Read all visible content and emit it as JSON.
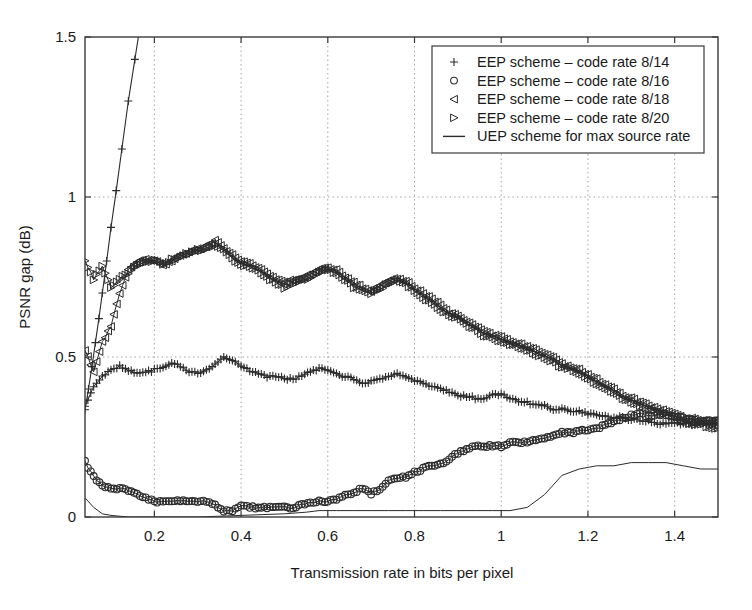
{
  "chart_data": {
    "type": "line",
    "title": "",
    "xlabel": "Transmission rate in bits per pixel",
    "ylabel": "PSNR gap (dB)",
    "xlim": [
      0.04,
      1.5
    ],
    "ylim": [
      0,
      1.5
    ],
    "xticks": [
      0.2,
      0.4,
      0.6,
      0.8,
      1,
      1.2,
      1.4
    ],
    "xtick_labels": [
      "0.2",
      "0.4",
      "0.6",
      "0.8",
      "1",
      "1.2",
      "1.4"
    ],
    "yticks": [
      0,
      0.5,
      1,
      1.5
    ],
    "ytick_labels": [
      "0",
      "0.5",
      "1",
      "1.5"
    ],
    "grid": "dotted-both-axes",
    "legend_position": "top-right",
    "line_color": "#2b2b2b",
    "grid_color": "#9a9a9a",
    "axis_color": "#3a3a3a",
    "series": [
      {
        "name": "EEP scheme – code rate 8/14",
        "marker": "plus",
        "x": [
          0.04,
          0.06,
          0.08,
          0.1,
          0.12,
          0.14,
          0.16,
          0.18,
          0.2,
          0.22,
          0.24,
          0.26,
          0.28,
          0.3,
          0.32,
          0.34,
          0.36,
          0.38,
          0.4,
          0.42,
          0.44,
          0.46,
          0.48,
          0.5,
          0.52,
          0.54,
          0.56,
          0.58,
          0.6,
          0.62,
          0.64,
          0.66,
          0.68,
          0.7,
          0.72,
          0.74,
          0.76,
          0.78,
          0.8,
          0.82,
          0.84,
          0.86,
          0.88,
          0.9,
          0.92,
          0.94,
          0.96,
          0.98,
          1.0,
          1.02,
          1.04,
          1.06,
          1.08,
          1.1,
          1.12,
          1.14,
          1.16,
          1.18,
          1.2,
          1.22,
          1.24,
          1.26,
          1.28,
          1.3,
          1.32,
          1.34,
          1.36,
          1.38,
          1.4,
          1.42,
          1.44,
          1.46,
          1.48,
          1.5
        ],
        "y": [
          0.35,
          0.4,
          0.44,
          0.46,
          0.47,
          0.46,
          0.45,
          0.45,
          0.46,
          0.47,
          0.48,
          0.47,
          0.46,
          0.45,
          0.46,
          0.48,
          0.5,
          0.49,
          0.47,
          0.46,
          0.45,
          0.44,
          0.44,
          0.43,
          0.43,
          0.44,
          0.45,
          0.46,
          0.46,
          0.45,
          0.44,
          0.43,
          0.42,
          0.42,
          0.43,
          0.44,
          0.45,
          0.44,
          0.43,
          0.42,
          0.41,
          0.4,
          0.39,
          0.38,
          0.38,
          0.37,
          0.37,
          0.38,
          0.38,
          0.37,
          0.36,
          0.36,
          0.35,
          0.35,
          0.34,
          0.34,
          0.33,
          0.33,
          0.32,
          0.32,
          0.31,
          0.31,
          0.31,
          0.3,
          0.3,
          0.3,
          0.29,
          0.29,
          0.29,
          0.29,
          0.29,
          0.29,
          0.29,
          0.29
        ],
        "note": "steep rising branch at left exits top of axes"
      },
      {
        "name": "EEP scheme – code rate 8/16",
        "marker": "circle",
        "x": [
          0.04,
          0.06,
          0.08,
          0.1,
          0.12,
          0.14,
          0.16,
          0.18,
          0.2,
          0.22,
          0.24,
          0.26,
          0.28,
          0.3,
          0.32,
          0.34,
          0.36,
          0.38,
          0.4,
          0.42,
          0.44,
          0.46,
          0.48,
          0.5,
          0.52,
          0.54,
          0.56,
          0.58,
          0.6,
          0.62,
          0.64,
          0.66,
          0.68,
          0.7,
          0.72,
          0.74,
          0.76,
          0.78,
          0.8,
          0.82,
          0.84,
          0.86,
          0.88,
          0.9,
          0.92,
          0.94,
          0.96,
          0.98,
          1.0,
          1.02,
          1.04,
          1.06,
          1.08,
          1.1,
          1.12,
          1.14,
          1.16,
          1.18,
          1.2,
          1.22,
          1.24,
          1.26,
          1.28,
          1.3,
          1.32,
          1.34,
          1.36,
          1.38,
          1.4,
          1.42,
          1.44,
          1.46,
          1.48,
          1.5
        ],
        "y": [
          0.17,
          0.13,
          0.1,
          0.09,
          0.09,
          0.08,
          0.07,
          0.06,
          0.05,
          0.05,
          0.05,
          0.05,
          0.05,
          0.05,
          0.05,
          0.04,
          0.02,
          0.02,
          0.03,
          0.03,
          0.03,
          0.03,
          0.03,
          0.03,
          0.03,
          0.04,
          0.04,
          0.05,
          0.05,
          0.06,
          0.07,
          0.08,
          0.09,
          0.07,
          0.09,
          0.11,
          0.12,
          0.13,
          0.14,
          0.15,
          0.16,
          0.17,
          0.18,
          0.2,
          0.21,
          0.22,
          0.22,
          0.22,
          0.22,
          0.23,
          0.23,
          0.24,
          0.24,
          0.25,
          0.25,
          0.26,
          0.26,
          0.27,
          0.27,
          0.28,
          0.29,
          0.3,
          0.31,
          0.32,
          0.32,
          0.32,
          0.32,
          0.32,
          0.31,
          0.31,
          0.3,
          0.3,
          0.3,
          0.3
        ]
      },
      {
        "name": "EEP scheme – code rate 8/18",
        "marker": "triangle-left",
        "x": [
          0.04,
          0.06,
          0.08,
          0.1,
          0.12,
          0.14,
          0.16,
          0.18,
          0.2,
          0.22,
          0.24,
          0.26,
          0.28,
          0.3,
          0.32,
          0.34,
          0.36,
          0.38,
          0.4,
          0.42,
          0.44,
          0.46,
          0.48,
          0.5,
          0.52,
          0.54,
          0.56,
          0.58,
          0.6,
          0.62,
          0.64,
          0.66,
          0.68,
          0.7,
          0.72,
          0.74,
          0.76,
          0.78,
          0.8,
          0.82,
          0.84,
          0.86,
          0.88,
          0.9,
          0.92,
          0.94,
          0.96,
          0.98,
          1.0,
          1.02,
          1.04,
          1.06,
          1.08,
          1.1,
          1.12,
          1.14,
          1.16,
          1.18,
          1.2,
          1.22,
          1.24,
          1.26,
          1.28,
          1.3,
          1.32,
          1.34,
          1.36,
          1.38,
          1.4,
          1.42,
          1.44,
          1.46,
          1.48,
          1.5
        ],
        "y": [
          0.52,
          0.46,
          0.55,
          0.6,
          0.7,
          0.78,
          0.8,
          0.81,
          0.8,
          0.79,
          0.8,
          0.82,
          0.83,
          0.84,
          0.85,
          0.86,
          0.84,
          0.82,
          0.8,
          0.79,
          0.78,
          0.76,
          0.74,
          0.73,
          0.74,
          0.75,
          0.76,
          0.77,
          0.78,
          0.77,
          0.75,
          0.73,
          0.72,
          0.71,
          0.72,
          0.74,
          0.75,
          0.74,
          0.72,
          0.7,
          0.68,
          0.66,
          0.64,
          0.63,
          0.61,
          0.6,
          0.58,
          0.57,
          0.56,
          0.55,
          0.54,
          0.53,
          0.52,
          0.51,
          0.5,
          0.48,
          0.47,
          0.46,
          0.44,
          0.43,
          0.41,
          0.4,
          0.38,
          0.37,
          0.36,
          0.35,
          0.34,
          0.33,
          0.32,
          0.31,
          0.31,
          0.3,
          0.3,
          0.3
        ]
      },
      {
        "name": "EEP scheme – code rate 8/20",
        "marker": "triangle-right",
        "x": [
          0.04,
          0.06,
          0.08,
          0.1,
          0.12,
          0.14,
          0.16,
          0.18,
          0.2,
          0.22,
          0.24,
          0.26,
          0.28,
          0.3,
          0.32,
          0.34,
          0.36,
          0.38,
          0.4,
          0.42,
          0.44,
          0.46,
          0.48,
          0.5,
          0.52,
          0.54,
          0.56,
          0.58,
          0.6,
          0.62,
          0.64,
          0.66,
          0.68,
          0.7,
          0.72,
          0.74,
          0.76,
          0.78,
          0.8,
          0.82,
          0.84,
          0.86,
          0.88,
          0.9,
          0.92,
          0.94,
          0.96,
          0.98,
          1.0,
          1.02,
          1.04,
          1.06,
          1.08,
          1.1,
          1.12,
          1.14,
          1.16,
          1.18,
          1.2,
          1.22,
          1.24,
          1.26,
          1.28,
          1.3,
          1.32,
          1.34,
          1.36,
          1.38,
          1.4,
          1.42,
          1.44,
          1.46,
          1.48,
          1.5
        ],
        "y": [
          0.8,
          0.74,
          0.78,
          0.72,
          0.74,
          0.76,
          0.79,
          0.8,
          0.8,
          0.79,
          0.8,
          0.81,
          0.82,
          0.83,
          0.84,
          0.85,
          0.83,
          0.81,
          0.79,
          0.78,
          0.77,
          0.75,
          0.73,
          0.72,
          0.73,
          0.74,
          0.75,
          0.76,
          0.77,
          0.76,
          0.74,
          0.72,
          0.71,
          0.7,
          0.71,
          0.73,
          0.74,
          0.73,
          0.71,
          0.69,
          0.67,
          0.65,
          0.63,
          0.62,
          0.6,
          0.59,
          0.57,
          0.56,
          0.55,
          0.54,
          0.53,
          0.52,
          0.51,
          0.5,
          0.49,
          0.47,
          0.46,
          0.45,
          0.43,
          0.42,
          0.4,
          0.39,
          0.37,
          0.36,
          0.35,
          0.34,
          0.33,
          0.32,
          0.31,
          0.3,
          0.29,
          0.29,
          0.28,
          0.28
        ]
      },
      {
        "name": "UEP scheme for max source rate",
        "marker": "none",
        "x": [
          0.04,
          0.06,
          0.08,
          0.1,
          0.14,
          0.2,
          0.3,
          0.4,
          0.5,
          0.55,
          0.58,
          0.62,
          0.66,
          0.7,
          0.74,
          0.78,
          0.82,
          0.86,
          0.9,
          0.94,
          0.98,
          1.02,
          1.06,
          1.1,
          1.14,
          1.18,
          1.22,
          1.26,
          1.3,
          1.34,
          1.38,
          1.42,
          1.46,
          1.5
        ],
        "y": [
          0.06,
          0.03,
          0.01,
          0.005,
          0.0,
          0.0,
          0.0,
          0.005,
          0.01,
          0.015,
          0.02,
          0.02,
          0.02,
          0.02,
          0.02,
          0.02,
          0.02,
          0.02,
          0.02,
          0.02,
          0.02,
          0.02,
          0.03,
          0.07,
          0.13,
          0.15,
          0.16,
          0.16,
          0.17,
          0.17,
          0.17,
          0.16,
          0.15,
          0.15
        ]
      }
    ]
  },
  "legend": {
    "items": [
      {
        "label": "EEP scheme – code rate 8/14",
        "marker": "plus"
      },
      {
        "label": "EEP scheme – code rate 8/16",
        "marker": "circle"
      },
      {
        "label": "EEP scheme – code rate 8/18",
        "marker": "triangle-left"
      },
      {
        "label": "EEP scheme – code rate 8/20",
        "marker": "triangle-right"
      },
      {
        "label": "UEP scheme for max source rate",
        "marker": "line"
      }
    ]
  }
}
